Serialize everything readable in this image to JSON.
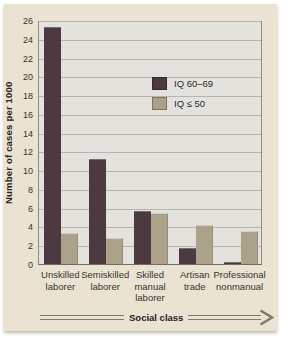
{
  "chart_data": {
    "type": "bar",
    "title": "",
    "categories": [
      "Unskilled laborer",
      "Semiskilled laborer",
      "Skilled manual laborer",
      "Artisan trade",
      "Professional nonmanual"
    ],
    "series": [
      {
        "name": "IQ 60–69",
        "color": "#4c3a40",
        "values": [
          25.3,
          11.2,
          5.6,
          1.7,
          0.25
        ]
      },
      {
        "name": "IQ ≤ 50",
        "color": "#aca28a",
        "values": [
          3.3,
          2.8,
          5.4,
          4.2,
          3.5
        ]
      }
    ],
    "xlabel": "Social class",
    "ylabel": "Number of cases per 1000",
    "ylim": [
      0,
      26
    ],
    "ytick_step": 2,
    "grid": true,
    "legend": {
      "position": "upper-right-inside",
      "entries": [
        "IQ 60–69",
        "IQ ≤ 50"
      ]
    },
    "colors": {
      "panel_bg": "#eae3d1",
      "plot_bg": "#e3e2dc",
      "gridline": "#b6b5ae",
      "plot_border": "#8e8d85",
      "text": "#333130",
      "arrow": "#7b7a70",
      "series_dark": "#4c3a40",
      "series_tan": "#aca28a"
    }
  }
}
